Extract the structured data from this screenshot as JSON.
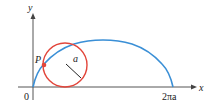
{
  "diagram": {
    "axes": {
      "x_label": "x",
      "y_label": "y",
      "origin_label": "0",
      "x_end_label": "2πa"
    },
    "labels": {
      "point": "P",
      "radius": "a"
    },
    "colors": {
      "curve": "#3a8fd6",
      "circle": "#e2463b",
      "axes": "#555555",
      "point": "#e2463b",
      "radius_line": "#222222"
    }
  }
}
